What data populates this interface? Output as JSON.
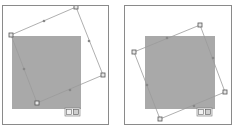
{
  "panels": [
    {
      "name": "rotate-step-1",
      "frame": {
        "x": 2,
        "y": 5,
        "w": 107,
        "h": 120
      },
      "shape": {
        "x": 9,
        "y": 30,
        "w": 69,
        "h": 73,
        "fill": "#a9a9a9"
      },
      "handles": [
        [
          8,
          29
        ],
        [
          73,
          1
        ],
        [
          100,
          69
        ],
        [
          34,
          97
        ]
      ],
      "midpoints": [
        [
          41,
          15
        ],
        [
          86,
          35
        ],
        [
          67,
          84
        ],
        [
          21,
          63
        ]
      ],
      "toolbar": {
        "x": 62,
        "y": 102,
        "w": 15,
        "h": 8,
        "label": "⟲ ⟳"
      }
    },
    {
      "name": "rotate-step-2",
      "frame": {
        "x": 124,
        "y": 5,
        "w": 108,
        "h": 120
      },
      "shape": {
        "x": 20,
        "y": 30,
        "w": 70,
        "h": 73,
        "fill": "#a9a9a9"
      },
      "handles": [
        [
          9,
          46
        ],
        [
          75,
          19
        ],
        [
          100,
          86
        ],
        [
          35,
          113
        ]
      ],
      "midpoints": [
        [
          42,
          32
        ],
        [
          88,
          52
        ],
        [
          69,
          100
        ],
        [
          22,
          79
        ]
      ],
      "toolbar": {
        "x": 72,
        "y": 102,
        "w": 15,
        "h": 8,
        "label": "⟲ ⟳"
      }
    }
  ],
  "colors": {
    "frame": "#8a8a8a",
    "shape": "#a9a9a9",
    "outline": "#9a9a9a",
    "handle_fill": "#e8e8e8",
    "handle_stroke": "#555555"
  }
}
